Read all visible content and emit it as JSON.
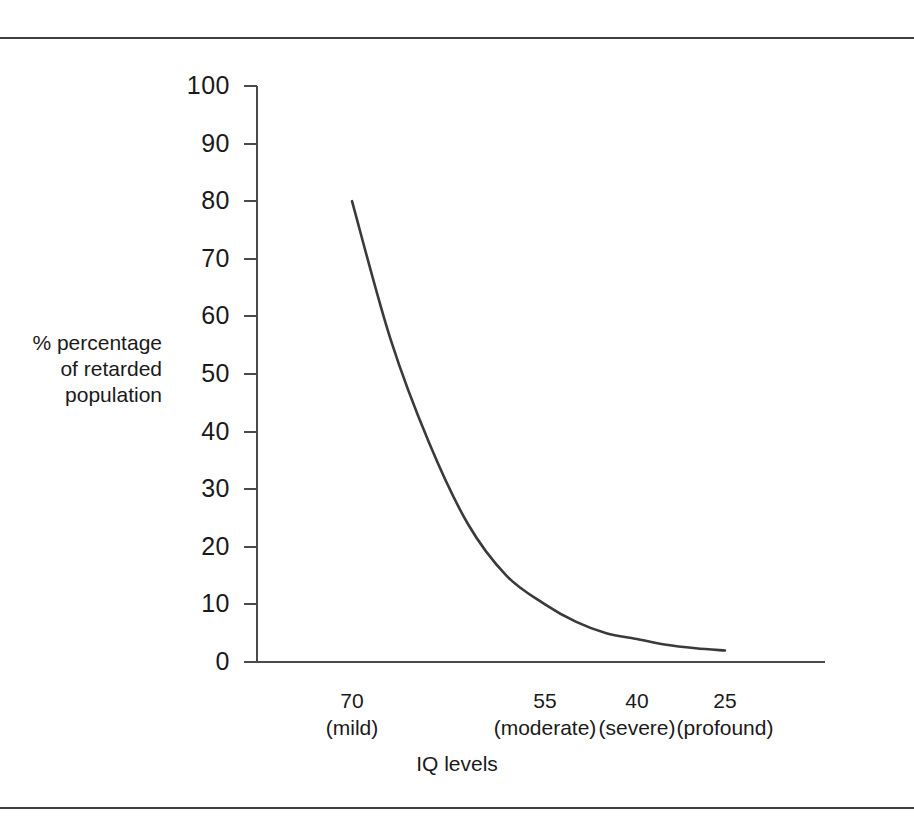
{
  "figure": {
    "rule_color": "#404040",
    "axis_color": "#4a4a4a",
    "curve_color": "#3a3a3a",
    "background": "#ffffff"
  },
  "chart_data": {
    "type": "line",
    "title": "",
    "subtitle": "",
    "xlabel": "IQ levels",
    "ylabel": "% percentage of retarded population",
    "ylabel_lines": [
      "% percentage",
      "of retarded",
      "population"
    ],
    "grid": false,
    "legend": "none",
    "ylim": [
      0,
      100
    ],
    "y_ticks": [
      100,
      90,
      80,
      70,
      60,
      50,
      40,
      30,
      20,
      10,
      0
    ],
    "y_tick_labels": [
      "100",
      "90",
      "80",
      "70",
      "60",
      "50",
      "40",
      "30",
      "20",
      "10",
      "0"
    ],
    "categories": [
      "70",
      "55",
      "40",
      "25"
    ],
    "category_terms": [
      "(mild)",
      "(moderate)",
      "(severe)",
      "(profound)"
    ],
    "category_labels": [
      "70 (mild)",
      "55 (moderate)",
      "40 (severe)",
      "25 (profound)"
    ],
    "x": [
      70,
      55,
      40,
      25
    ],
    "values": [
      80,
      10,
      4,
      2
    ],
    "series": [
      {
        "name": "% of retarded population",
        "values": [
          80,
          10,
          4,
          2
        ]
      }
    ],
    "curve_points": [
      {
        "iq": 70,
        "percent": 80
      },
      {
        "iq": 67,
        "percent": 56
      },
      {
        "iq": 64,
        "percent": 38
      },
      {
        "iq": 61,
        "percent": 24
      },
      {
        "iq": 58,
        "percent": 15
      },
      {
        "iq": 55,
        "percent": 10
      },
      {
        "iq": 50,
        "percent": 7
      },
      {
        "iq": 45,
        "percent": 5
      },
      {
        "iq": 40,
        "percent": 4
      },
      {
        "iq": 35,
        "percent": 3
      },
      {
        "iq": 30,
        "percent": 2.4
      },
      {
        "iq": 25,
        "percent": 2
      }
    ],
    "annotations": []
  },
  "axis_title": {
    "x": "IQ levels"
  }
}
